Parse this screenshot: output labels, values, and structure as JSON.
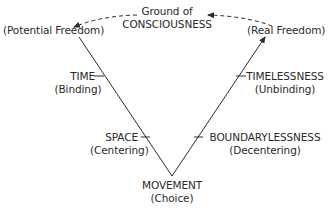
{
  "top": {
    "line1": "Ground of",
    "line2": "CONSCIOUSNESS"
  },
  "left_top": {
    "label": "(Potential Freedom)"
  },
  "right_top": {
    "label": "(Real Freedom)"
  },
  "left_axis": {
    "upper": {
      "term": "TIME",
      "sub": "(Binding)"
    },
    "lower": {
      "term": "SPACE",
      "sub": "(Centering)"
    }
  },
  "right_axis": {
    "upper": {
      "term": "TIMELESSNESS",
      "sub": "(Unbinding)"
    },
    "lower": {
      "term": "BOUNDARYLESSNESS",
      "sub": "(Decentering)"
    }
  },
  "apex": {
    "term": "MOVEMENT",
    "sub": "(Choice)"
  },
  "colors": {
    "ink": "#2a2a2a",
    "background": "#ffffff"
  }
}
